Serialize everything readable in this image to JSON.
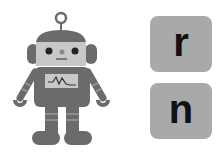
{
  "robot": {
    "description": "robot illustration",
    "body_color": "#6b6b6b",
    "face_color": "#c8c8c8"
  },
  "tiles": [
    {
      "letter": "r"
    },
    {
      "letter": "n"
    }
  ],
  "colors": {
    "tile_bg": "#a9a9a9",
    "letter": "#111111"
  }
}
